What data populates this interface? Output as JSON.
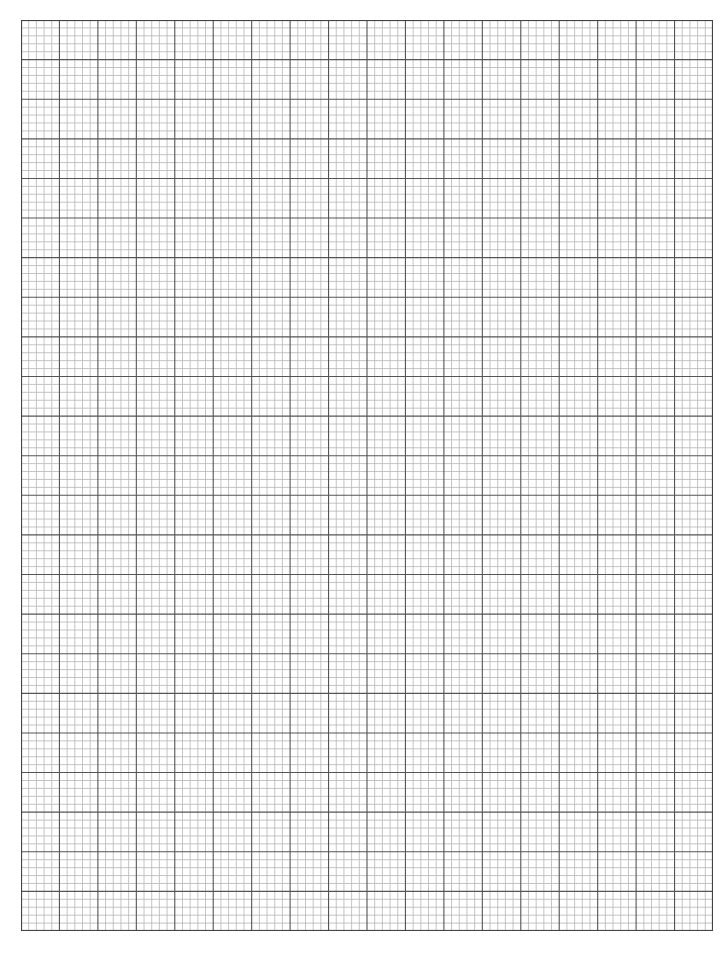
{
  "page": {
    "type": "graph-paper",
    "background": "#ffffff"
  },
  "grid": {
    "major_columns": 18,
    "major_rows": 23,
    "minor_per_major": 5,
    "major_color": "#555555",
    "minor_color": "#b5b5b5",
    "border_color": "#444444"
  }
}
